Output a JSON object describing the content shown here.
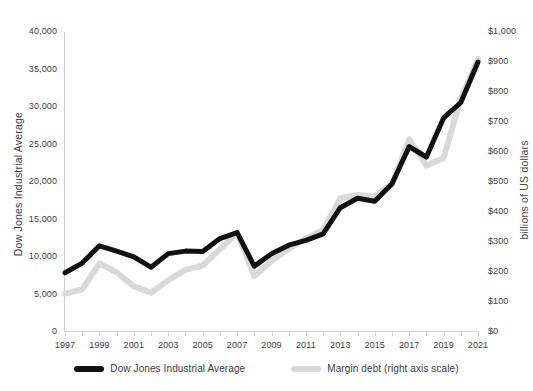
{
  "chart_data": {
    "type": "line",
    "title": "",
    "xlabel": "",
    "ylabel": "Dow Jones Industrial Average",
    "y2label": "billions of US dollars",
    "x": [
      1997,
      1998,
      1999,
      2000,
      2001,
      2002,
      2003,
      2004,
      2005,
      2006,
      2007,
      2008,
      2009,
      2010,
      2011,
      2012,
      2013,
      2014,
      2015,
      2016,
      2017,
      2018,
      2019,
      2020,
      2021
    ],
    "xtick_labels": [
      "1997",
      "1999",
      "2001",
      "2003",
      "2005",
      "2007",
      "2009",
      "2011",
      "2013",
      "2015",
      "2017",
      "2019",
      "2021"
    ],
    "xtick_values": [
      1997,
      1999,
      2001,
      2003,
      2005,
      2007,
      2009,
      2011,
      2013,
      2015,
      2017,
      2019,
      2021
    ],
    "ytick_labels": [
      "0",
      "5,000",
      "10,000",
      "15,000",
      "20,000",
      "25,000",
      "30,000",
      "35,000",
      "40,000"
    ],
    "ytick_values": [
      0,
      5000,
      10000,
      15000,
      20000,
      25000,
      30000,
      35000,
      40000
    ],
    "y2tick_labels": [
      "$0",
      "$100",
      "$200",
      "$300",
      "$400",
      "$500",
      "$600",
      "$700",
      "$800",
      "$900",
      "$1,000"
    ],
    "y2tick_values": [
      0,
      100,
      200,
      300,
      400,
      500,
      600,
      700,
      800,
      900,
      1000
    ],
    "ylim": [
      0,
      40000
    ],
    "y2lim": [
      0,
      1000
    ],
    "xlim": [
      1997,
      2021
    ],
    "grid": false,
    "legend_position": "bottom",
    "series": [
      {
        "name": "Dow Jones Industrial Average",
        "axis": "left",
        "color": "#111111",
        "values": [
          7900,
          9180,
          11500,
          10790,
          10020,
          8640,
          10450,
          10780,
          10720,
          12460,
          13260,
          8780,
          10430,
          11570,
          12220,
          13100,
          16580,
          17820,
          17420,
          19760,
          24720,
          23330,
          28540,
          30600,
          36000
        ]
      },
      {
        "name": "Margin debt (right axis scale)",
        "axis": "right",
        "color": "#d9d9d9",
        "values": [
          128,
          142,
          229,
          199,
          152,
          131,
          173,
          207,
          221,
          276,
          330,
          187,
          237,
          277,
          312,
          340,
          445,
          457,
          453,
          493,
          643,
          555,
          580,
          778,
          910
        ]
      }
    ]
  },
  "legend": {
    "items": [
      {
        "label": "Dow Jones Industrial Average",
        "color": "#111111",
        "swatch_name": "legend-swatch-dow"
      },
      {
        "label": "Margin debt (right axis scale)",
        "color": "#d9d9d9",
        "swatch_name": "legend-swatch-margin"
      }
    ]
  }
}
